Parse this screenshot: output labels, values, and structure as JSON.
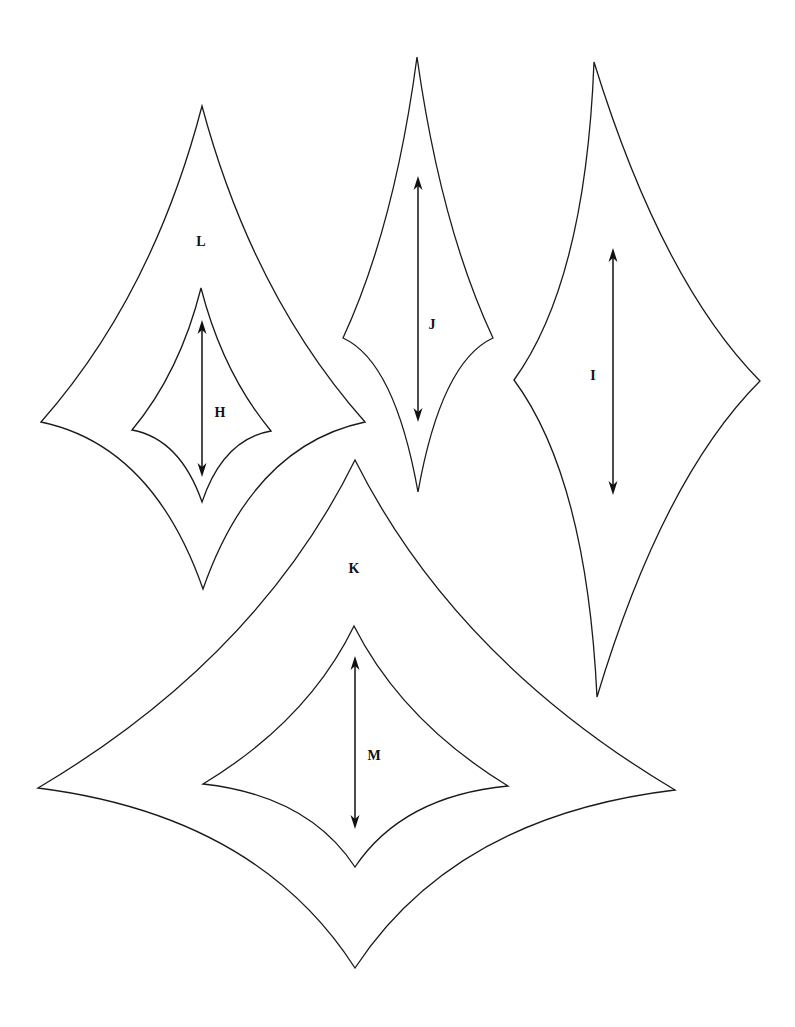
{
  "diagram": {
    "stroke_color": "#1a1a1a",
    "background": "#ffffff",
    "shapes": [
      {
        "id": "L",
        "label": "L",
        "label_pos": [
          201,
          246
        ],
        "vertices": {
          "top": [
            202,
            106
          ],
          "right": [
            365,
            422
          ],
          "bottom": [
            203,
            589
          ],
          "left": [
            41,
            422
          ]
        },
        "arrow": null
      },
      {
        "id": "H",
        "label": "H",
        "label_pos": [
          220,
          417
        ],
        "vertices": {
          "top": [
            201,
            288
          ],
          "right": [
            271,
            431
          ],
          "bottom": [
            202,
            502
          ],
          "left": [
            132,
            430
          ]
        },
        "arrow": {
          "x": 202,
          "y1": 320,
          "y2": 477
        }
      },
      {
        "id": "J",
        "label": "J",
        "label_pos": [
          432,
          329
        ],
        "vertices": {
          "top": [
            417,
            57
          ],
          "right": [
            493,
            338
          ],
          "bottom": [
            418,
            492
          ],
          "left": [
            343,
            338
          ]
        },
        "arrow": {
          "x": 418,
          "y1": 176,
          "y2": 422
        }
      },
      {
        "id": "I",
        "label": "I",
        "label_pos": [
          593,
          380
        ],
        "vertices": {
          "top": [
            594,
            62
          ],
          "right": [
            760,
            381
          ],
          "bottom": [
            597,
            697
          ],
          "left": [
            514,
            380
          ]
        },
        "arrow": {
          "x": 613,
          "y1": 248,
          "y2": 495
        }
      },
      {
        "id": "K",
        "label": "K",
        "label_pos": [
          354,
          573
        ],
        "vertices": {
          "top": [
            355,
            460
          ],
          "right": [
            675,
            790
          ],
          "bottom": [
            355,
            968
          ],
          "left": [
            38,
            788
          ]
        },
        "arrow": null
      },
      {
        "id": "M",
        "label": "M",
        "label_pos": [
          374,
          760
        ],
        "vertices": {
          "top": [
            354,
            626
          ],
          "right": [
            508,
            786
          ],
          "bottom": [
            355,
            867
          ],
          "left": [
            203,
            784
          ]
        },
        "arrow": {
          "x": 355,
          "y1": 656,
          "y2": 829
        }
      }
    ]
  }
}
